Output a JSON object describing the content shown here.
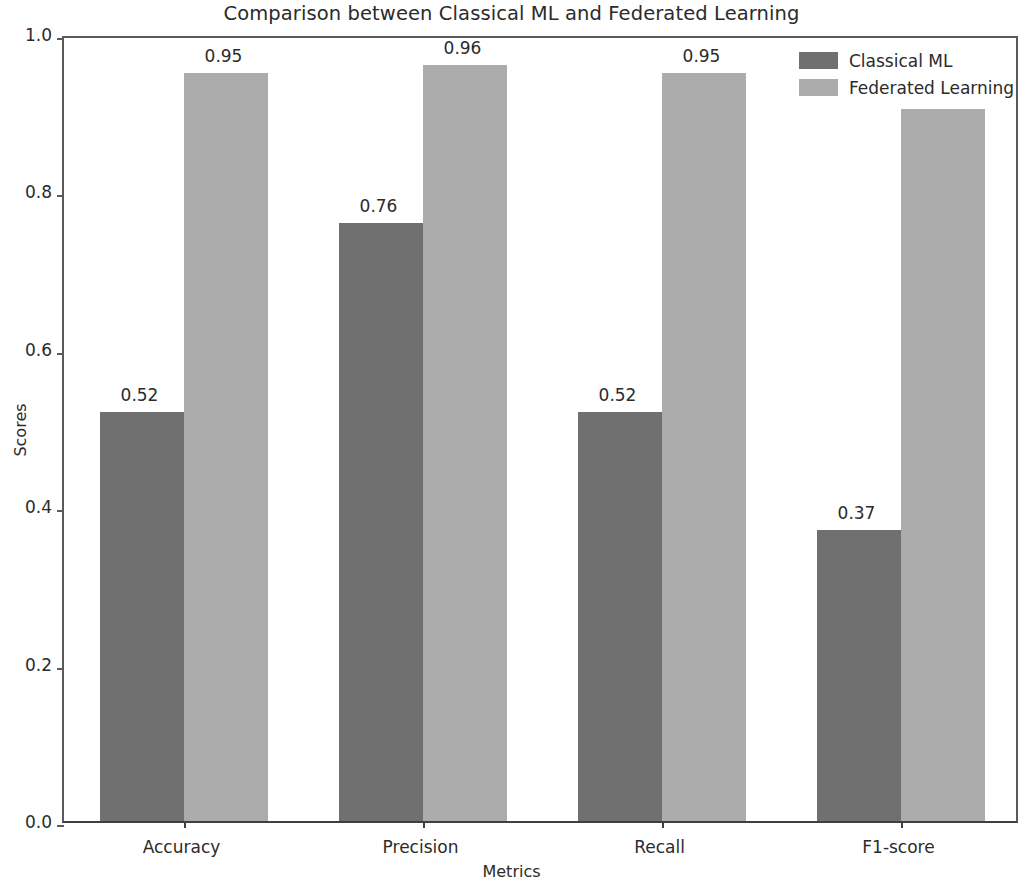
{
  "chart_data": {
    "type": "bar",
    "title": "Comparison between Classical ML and Federated Learning",
    "xlabel": "Metrics",
    "ylabel": "Scores",
    "categories": [
      "Accuracy",
      "Precision",
      "Recall",
      "F1-score"
    ],
    "series": [
      {
        "name": "Classical ML",
        "color": "#707070",
        "values": [
          0.52,
          0.76,
          0.52,
          0.37
        ],
        "labels": [
          "0.52",
          "0.76",
          "0.52",
          "0.37"
        ]
      },
      {
        "name": "Federated Learning",
        "color": "#acacac",
        "values": [
          0.95,
          0.96,
          0.95,
          0.92
        ],
        "labels": [
          "0.95",
          "0.96",
          "0.95",
          "0.92"
        ]
      }
    ],
    "ylim": [
      0.0,
      1.0
    ],
    "yticks": [
      0.0,
      0.2,
      0.4,
      0.6,
      0.8,
      1.0
    ],
    "ytick_labels": [
      "0.0",
      "0.2",
      "0.4",
      "0.6",
      "0.8",
      "1.0"
    ],
    "grid": false,
    "legend_position": "upper right",
    "bar_value_labels_shown_for": "Classical ML and Federated Learning (F1-score federated label hidden behind legend)"
  }
}
